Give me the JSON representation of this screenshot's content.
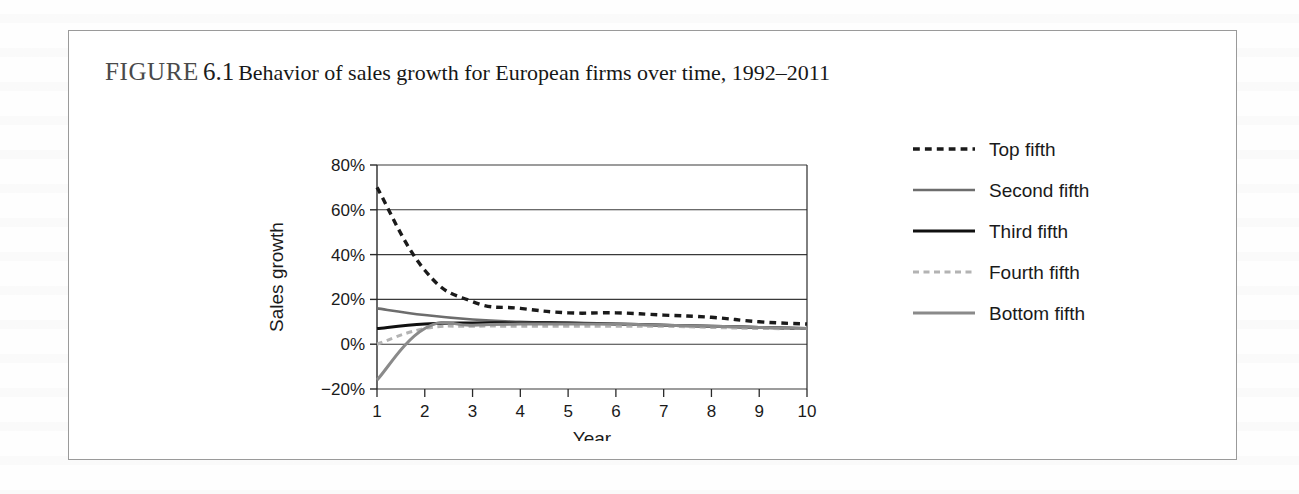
{
  "figure": {
    "label": "FIGURE",
    "number": "6.1",
    "caption": "Behavior of sales growth for European firms over time, 1992–2011"
  },
  "chart_data": {
    "type": "line",
    "title": "Behavior of sales growth for European firms over time, 1992–2011",
    "xlabel": "Year",
    "ylabel": "Sales growth",
    "x": [
      1,
      2,
      3,
      4,
      5,
      6,
      7,
      8,
      9,
      10
    ],
    "categories": [
      "1",
      "2",
      "3",
      "4",
      "5",
      "6",
      "7",
      "8",
      "9",
      "10"
    ],
    "xtick_labels": [
      "1",
      "2",
      "3",
      "4",
      "5",
      "6",
      "7",
      "8",
      "9",
      "10"
    ],
    "ytick_labels": [
      "80%",
      "60%",
      "40%",
      "20%",
      "0%",
      "−20%"
    ],
    "ytick_values": [
      80,
      60,
      40,
      20,
      0,
      -20
    ],
    "ylim": [
      -20,
      80
    ],
    "xlim": [
      1,
      10
    ],
    "grid": "horizontal",
    "legend_position": "right",
    "series": [
      {
        "name": "Top fifth",
        "values": [
          70,
          33,
          19,
          16,
          14,
          14,
          13,
          12,
          10,
          9
        ],
        "color": "#1a1a1a",
        "style": "dashed",
        "width": 3.4
      },
      {
        "name": "Second fifth",
        "values": [
          16,
          13,
          11,
          10,
          9.5,
          9,
          8.5,
          8,
          7.5,
          7
        ],
        "color": "#6d6d6d",
        "style": "solid",
        "width": 2.6
      },
      {
        "name": "Third fifth",
        "values": [
          7,
          9,
          9.5,
          9.5,
          9.5,
          9,
          8.5,
          8,
          7.5,
          7
        ],
        "color": "#101010",
        "style": "solid",
        "width": 3.0
      },
      {
        "name": "Fourth fifth",
        "values": [
          0,
          7,
          8,
          8,
          8,
          8,
          8,
          7.5,
          7,
          7
        ],
        "color": "#b3b3b3",
        "style": "dashed",
        "width": 3.0
      },
      {
        "name": "Bottom fifth",
        "values": [
          -16,
          7,
          8.5,
          9,
          9,
          9,
          8.5,
          8,
          7.5,
          7
        ],
        "color": "#8a8a8a",
        "style": "solid",
        "width": 3.0
      }
    ]
  }
}
